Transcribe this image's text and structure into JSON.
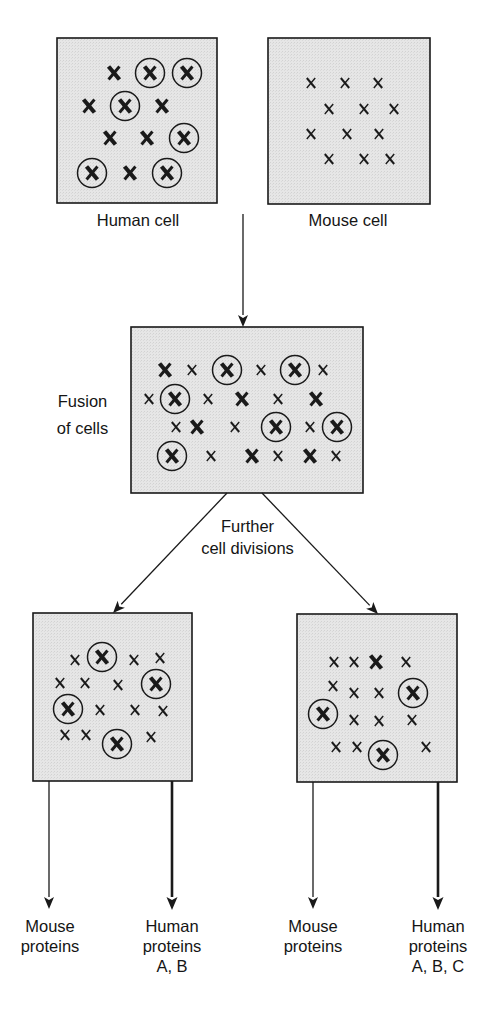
{
  "colors": {
    "cell_fill": "#e3e3e3",
    "stroke": "#1a1a1a",
    "background": "#ffffff"
  },
  "labels": {
    "human_cell": "Human cell",
    "mouse_cell": "Mouse cell",
    "fusion": [
      "Fusion",
      "of cells"
    ],
    "divisions": [
      "Further",
      "cell divisions"
    ],
    "outputs": [
      {
        "lines": [
          "Mouse",
          "proteins"
        ]
      },
      {
        "lines": [
          "Human",
          "proteins",
          "A, B"
        ]
      },
      {
        "lines": [
          "Mouse",
          "proteins"
        ]
      },
      {
        "lines": [
          "Human",
          "proteins",
          "A, B, C"
        ]
      }
    ]
  },
  "legend_semantics": {
    "large_x": "human chromosome",
    "small_x": "mouse chromosome",
    "circled_x": "human chromosome carrying gene of interest"
  },
  "cells": [
    {
      "id": "human-cell",
      "box": [
        57,
        38,
        160,
        165
      ],
      "chromosomes": [
        {
          "t": "H",
          "x": 57,
          "y": 35
        },
        {
          "t": "C",
          "x": 93,
          "y": 35
        },
        {
          "t": "C",
          "x": 130,
          "y": 35
        },
        {
          "t": "H",
          "x": 32,
          "y": 68
        },
        {
          "t": "C",
          "x": 68,
          "y": 68
        },
        {
          "t": "H",
          "x": 105,
          "y": 68
        },
        {
          "t": "H",
          "x": 53,
          "y": 100
        },
        {
          "t": "H",
          "x": 90,
          "y": 100
        },
        {
          "t": "C",
          "x": 127,
          "y": 100
        },
        {
          "t": "C",
          "x": 35,
          "y": 135
        },
        {
          "t": "H",
          "x": 73,
          "y": 135
        },
        {
          "t": "C",
          "x": 110,
          "y": 135
        }
      ]
    },
    {
      "id": "mouse-cell",
      "box": [
        268,
        38,
        162,
        166
      ],
      "chromosomes": [
        {
          "t": "m",
          "x": 43,
          "y": 45
        },
        {
          "t": "m",
          "x": 77,
          "y": 45
        },
        {
          "t": "m",
          "x": 110,
          "y": 45
        },
        {
          "t": "m",
          "x": 61,
          "y": 71
        },
        {
          "t": "m",
          "x": 96,
          "y": 71
        },
        {
          "t": "m",
          "x": 126,
          "y": 71
        },
        {
          "t": "m",
          "x": 43,
          "y": 96
        },
        {
          "t": "m",
          "x": 79,
          "y": 96
        },
        {
          "t": "m",
          "x": 111,
          "y": 96
        },
        {
          "t": "m",
          "x": 61,
          "y": 121
        },
        {
          "t": "m",
          "x": 96,
          "y": 121
        },
        {
          "t": "m",
          "x": 122,
          "y": 121
        }
      ]
    },
    {
      "id": "fusion-cell",
      "box": [
        131,
        327,
        232,
        166
      ],
      "chromosomes": [
        {
          "t": "H",
          "x": 34,
          "y": 43
        },
        {
          "t": "m",
          "x": 61,
          "y": 43
        },
        {
          "t": "C",
          "x": 96,
          "y": 43
        },
        {
          "t": "m",
          "x": 130,
          "y": 43
        },
        {
          "t": "C",
          "x": 164,
          "y": 43
        },
        {
          "t": "m",
          "x": 192,
          "y": 43
        },
        {
          "t": "m",
          "x": 18,
          "y": 72
        },
        {
          "t": "C",
          "x": 44,
          "y": 72
        },
        {
          "t": "m",
          "x": 77,
          "y": 72
        },
        {
          "t": "H",
          "x": 111,
          "y": 72
        },
        {
          "t": "m",
          "x": 147,
          "y": 72
        },
        {
          "t": "H",
          "x": 185,
          "y": 72
        },
        {
          "t": "m",
          "x": 45,
          "y": 100
        },
        {
          "t": "H",
          "x": 66,
          "y": 100
        },
        {
          "t": "m",
          "x": 104,
          "y": 100
        },
        {
          "t": "C",
          "x": 145,
          "y": 100
        },
        {
          "t": "m",
          "x": 179,
          "y": 100
        },
        {
          "t": "C",
          "x": 206,
          "y": 100
        },
        {
          "t": "C",
          "x": 41,
          "y": 129
        },
        {
          "t": "m",
          "x": 80,
          "y": 129
        },
        {
          "t": "H",
          "x": 121,
          "y": 129
        },
        {
          "t": "m",
          "x": 147,
          "y": 129
        },
        {
          "t": "H",
          "x": 179,
          "y": 129
        },
        {
          "t": "m",
          "x": 205,
          "y": 129
        }
      ]
    },
    {
      "id": "daughter-cell-left",
      "box": [
        33,
        613,
        159,
        168
      ],
      "chromosomes": [
        {
          "t": "m",
          "x": 42,
          "y": 47
        },
        {
          "t": "C",
          "x": 69,
          "y": 44
        },
        {
          "t": "m",
          "x": 101,
          "y": 47
        },
        {
          "t": "m",
          "x": 127,
          "y": 45
        },
        {
          "t": "m",
          "x": 27,
          "y": 70
        },
        {
          "t": "m",
          "x": 52,
          "y": 70
        },
        {
          "t": "m",
          "x": 85,
          "y": 72
        },
        {
          "t": "C",
          "x": 123,
          "y": 71
        },
        {
          "t": "C",
          "x": 35,
          "y": 96
        },
        {
          "t": "m",
          "x": 67,
          "y": 97
        },
        {
          "t": "m",
          "x": 102,
          "y": 97
        },
        {
          "t": "m",
          "x": 130,
          "y": 98
        },
        {
          "t": "m",
          "x": 32,
          "y": 122
        },
        {
          "t": "m",
          "x": 53,
          "y": 122
        },
        {
          "t": "C",
          "x": 84,
          "y": 131
        },
        {
          "t": "m",
          "x": 118,
          "y": 124
        }
      ]
    },
    {
      "id": "daughter-cell-right",
      "box": [
        297,
        614,
        160,
        168
      ],
      "chromosomes": [
        {
          "t": "m",
          "x": 37,
          "y": 48
        },
        {
          "t": "m",
          "x": 57,
          "y": 48
        },
        {
          "t": "H",
          "x": 79,
          "y": 48
        },
        {
          "t": "m",
          "x": 109,
          "y": 48
        },
        {
          "t": "m",
          "x": 36,
          "y": 72
        },
        {
          "t": "m",
          "x": 57,
          "y": 79
        },
        {
          "t": "m",
          "x": 82,
          "y": 79
        },
        {
          "t": "C",
          "x": 116,
          "y": 79
        },
        {
          "t": "C",
          "x": 26,
          "y": 100
        },
        {
          "t": "m",
          "x": 57,
          "y": 106
        },
        {
          "t": "m",
          "x": 82,
          "y": 107
        },
        {
          "t": "m",
          "x": 115,
          "y": 106
        },
        {
          "t": "m",
          "x": 39,
          "y": 133
        },
        {
          "t": "m",
          "x": 60,
          "y": 133
        },
        {
          "t": "C",
          "x": 86,
          "y": 141
        },
        {
          "t": "m",
          "x": 129,
          "y": 133
        }
      ]
    }
  ],
  "arrows": [
    {
      "id": "arrow-to-fusion",
      "x1": 243,
      "y1": 214,
      "x2": 243,
      "y2": 327,
      "w": 1.3
    },
    {
      "id": "arrow-to-left-daughter",
      "x1": 227,
      "y1": 493,
      "x2": 113,
      "y2": 613,
      "w": 1.3
    },
    {
      "id": "arrow-to-right-daughter",
      "x1": 262,
      "y1": 493,
      "x2": 378,
      "y2": 614,
      "w": 1.3
    },
    {
      "id": "arrow-left-mouse-proteins",
      "x1": 49,
      "y1": 781,
      "x2": 49,
      "y2": 909,
      "w": 1.3
    },
    {
      "id": "arrow-left-human-proteins",
      "x1": 172,
      "y1": 781,
      "x2": 172,
      "y2": 910,
      "w": 2.6
    },
    {
      "id": "arrow-right-mouse-proteins",
      "x1": 313,
      "y1": 782,
      "x2": 313,
      "y2": 909,
      "w": 1.3
    },
    {
      "id": "arrow-right-human-proteins",
      "x1": 438,
      "y1": 782,
      "x2": 438,
      "y2": 910,
      "w": 2.6
    }
  ]
}
